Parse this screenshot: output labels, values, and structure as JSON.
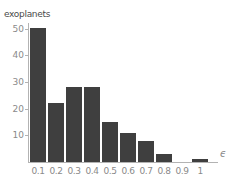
{
  "chart_data": {
    "type": "bar",
    "title": "exoplanets",
    "xlabel": "ϵ",
    "ylabel": "",
    "categories": [
      "0.1",
      "0.2",
      "0.3",
      "0.4",
      "0.5",
      "0.6",
      "0.7",
      "0.8",
      "0.9",
      "1"
    ],
    "values": [
      50,
      22,
      28,
      28,
      15,
      11,
      8,
      3,
      0,
      1
    ],
    "yticks": [
      10,
      20,
      30,
      40,
      50
    ],
    "ylim": [
      0,
      52
    ],
    "xlim": [
      0,
      1.05
    ],
    "grid": false,
    "legend_position": "none",
    "bar_color": "#3f3f3f",
    "axis_color": "#b3b3b3",
    "tick_label_color": "#8a8a8a",
    "title_color": "#4a4a4a",
    "background_color": "#ffffff"
  }
}
